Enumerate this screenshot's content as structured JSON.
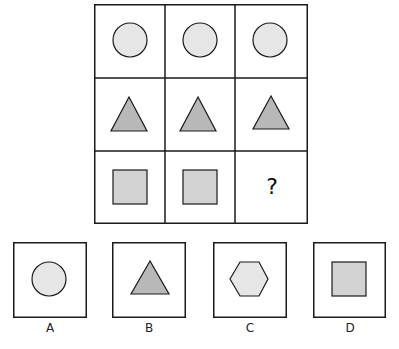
{
  "puzzle": {
    "grid": [
      [
        {
          "shape": "circle"
        },
        {
          "shape": "circle"
        },
        {
          "shape": "circle"
        }
      ],
      [
        {
          "shape": "triangle"
        },
        {
          "shape": "triangle"
        },
        {
          "shape": "triangle"
        }
      ],
      [
        {
          "shape": "square"
        },
        {
          "shape": "square"
        },
        {
          "shape": "missing",
          "text": "?"
        }
      ]
    ],
    "missing_mark": "?"
  },
  "options": [
    {
      "label": "A",
      "shape": "circle"
    },
    {
      "label": "B",
      "shape": "triangle"
    },
    {
      "label": "C",
      "shape": "hexagon"
    },
    {
      "label": "D",
      "shape": "square"
    }
  ],
  "colors": {
    "stroke": "#1a1a1a",
    "circle_fill": "#e6e6e6",
    "triangle_fill": "#b8b8b8",
    "square_fill": "#d2d2d2",
    "hexagon_fill": "#e6e6e6"
  }
}
